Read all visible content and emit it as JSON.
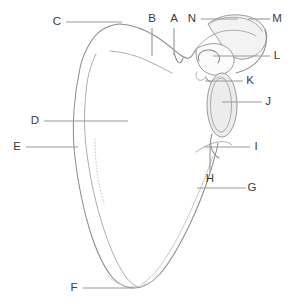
{
  "diagram": {
    "view": "anterior",
    "background_color": "#ffffff",
    "outline_color": "#8e8e8e",
    "leader_color": "#9a9a9a",
    "label_color": "#3b3b3b",
    "label_count": 14
  },
  "labels": {
    "a": "A",
    "b": "B",
    "c": "C",
    "d": "D",
    "e": "E",
    "f": "F",
    "g": "G",
    "h": "H",
    "i": "I",
    "j": "J",
    "k": "K",
    "l": "L",
    "m": "M",
    "n": "N"
  },
  "label_positions": {
    "a": {
      "x": 174,
      "y": 19
    },
    "b": {
      "x": 152,
      "y": 19
    },
    "c": {
      "x": 57,
      "y": 22
    },
    "d": {
      "x": 35,
      "y": 121
    },
    "e": {
      "x": 17,
      "y": 147
    },
    "f": {
      "x": 74,
      "y": 288
    },
    "g": {
      "x": 252,
      "y": 188
    },
    "h": {
      "x": 210,
      "y": 179
    },
    "i": {
      "x": 256,
      "y": 147
    },
    "j": {
      "x": 268,
      "y": 102
    },
    "k": {
      "x": 250,
      "y": 81
    },
    "l": {
      "x": 277,
      "y": 56
    },
    "m": {
      "x": 277,
      "y": 19
    },
    "n": {
      "x": 192,
      "y": 19
    }
  }
}
